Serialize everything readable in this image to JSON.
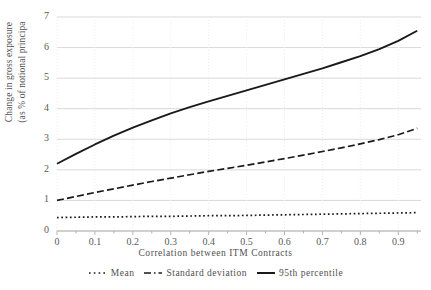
{
  "chart_data": {
    "type": "line",
    "title": "",
    "xlabel": "Correlation between ITM Contracts",
    "ylabel_line1": "Change in gross exposure",
    "ylabel_line2": "(as % of notional principa",
    "xlim": [
      0,
      0.96
    ],
    "ylim": [
      0,
      7
    ],
    "grid": true,
    "legend_position": "bottom",
    "xticks": [
      "0",
      "0.1",
      "0.2",
      "0.3",
      "0.4",
      "0.5",
      "0.6",
      "0.7",
      "0.8",
      "0.9"
    ],
    "xtick_values": [
      0,
      0.1,
      0.2,
      0.3,
      0.4,
      0.5,
      0.6,
      0.7,
      0.8,
      0.9
    ],
    "yticks": [
      "0",
      "1",
      "2",
      "3",
      "4",
      "5",
      "6",
      "7"
    ],
    "ytick_values": [
      0,
      1,
      2,
      3,
      4,
      5,
      6,
      7
    ],
    "x": [
      0,
      0.05,
      0.1,
      0.15,
      0.2,
      0.25,
      0.3,
      0.35,
      0.4,
      0.45,
      0.5,
      0.55,
      0.6,
      0.65,
      0.7,
      0.75,
      0.8,
      0.85,
      0.9,
      0.95
    ],
    "series": [
      {
        "name": "Mean",
        "style": "dotted",
        "color": "#1a1a1a",
        "values": [
          0.44,
          0.45,
          0.46,
          0.46,
          0.47,
          0.48,
          0.48,
          0.49,
          0.5,
          0.5,
          0.51,
          0.52,
          0.53,
          0.54,
          0.55,
          0.56,
          0.57,
          0.58,
          0.59,
          0.6
        ]
      },
      {
        "name": "Standard deviation",
        "style": "dashed",
        "color": "#1a1a1a",
        "values": [
          1.0,
          1.13,
          1.26,
          1.38,
          1.5,
          1.62,
          1.73,
          1.84,
          1.95,
          2.05,
          2.15,
          2.26,
          2.37,
          2.48,
          2.6,
          2.72,
          2.85,
          2.99,
          3.15,
          3.36
        ]
      },
      {
        "name": "95th percentile",
        "style": "solid",
        "color": "#1a1a1a",
        "values": [
          2.2,
          2.52,
          2.83,
          3.12,
          3.38,
          3.62,
          3.85,
          4.05,
          4.24,
          4.42,
          4.6,
          4.78,
          4.96,
          5.14,
          5.32,
          5.52,
          5.72,
          5.95,
          6.22,
          6.55
        ]
      }
    ]
  },
  "legend": {
    "items": [
      {
        "label": "Mean"
      },
      {
        "label": "Standard deviation"
      },
      {
        "label": "95th percentile"
      }
    ]
  },
  "colors": {
    "gridline": "#d9d9d9",
    "axis": "#b3b3b3",
    "line": "#1a1a1a",
    "text": "#4f4f4f"
  }
}
